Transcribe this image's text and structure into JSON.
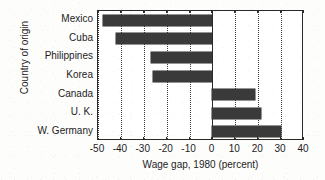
{
  "chart_data": {
    "type": "bar",
    "orientation": "horizontal",
    "title": "",
    "xlabel": "Wage gap, 1980 (percent)",
    "ylabel": "Country of origin",
    "categories": [
      "Mexico",
      "Cuba",
      "Philippines",
      "Korea",
      "Canada",
      "U. K.",
      "W. Germany"
    ],
    "values": [
      -48,
      -42,
      -27,
      -26,
      18.5,
      21,
      30
    ],
    "xlim": [
      -50,
      40
    ],
    "xticks": [
      -50,
      -40,
      -30,
      -20,
      -10,
      0,
      10,
      20,
      30,
      40
    ],
    "xticklabels": [
      "-50",
      "-40",
      "-30",
      "-20",
      "-10",
      "0",
      "10",
      "20",
      "30",
      "40"
    ],
    "grid": "vertical-dotted",
    "legend": "none",
    "bar_color": "#3a3a3a",
    "frame_color": "#2a2a2a",
    "background_color": "#ffffff"
  }
}
